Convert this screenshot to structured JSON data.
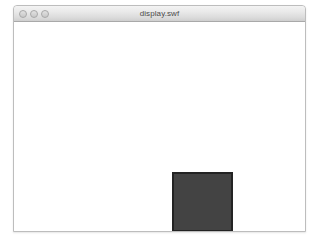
{
  "window": {
    "title": "display.swf",
    "controls": [
      {
        "name": "close",
        "label": "",
        "state": "inactive"
      },
      {
        "name": "minimize",
        "label": "",
        "state": "inactive"
      },
      {
        "name": "zoom",
        "label": "",
        "state": "inactive"
      }
    ]
  },
  "stage": {
    "shapes": [
      {
        "name": "gray-square",
        "type": "rectangle",
        "fill_color": "#434343",
        "border_color": "#232323",
        "x": 159,
        "y": 167,
        "width": 61,
        "height": 60
      }
    ],
    "background_color": "#ffffff"
  },
  "desktop": {
    "background_color": "#ffffff"
  }
}
